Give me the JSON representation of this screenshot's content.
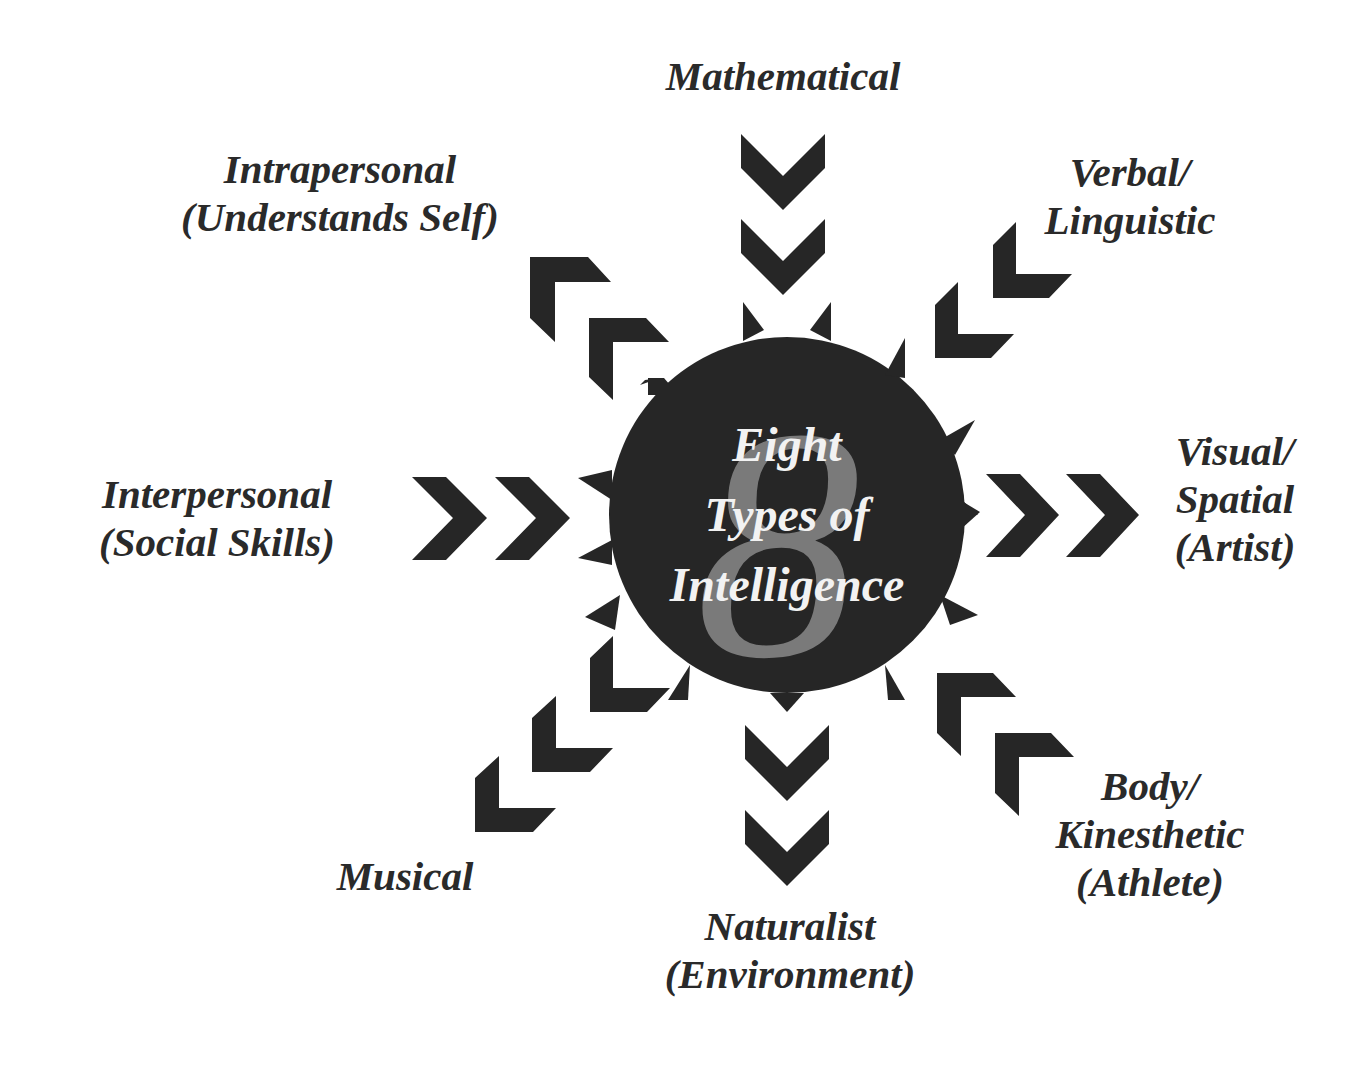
{
  "title": {
    "line1": "Eight",
    "line2": "Types of",
    "line3": "Intelligence",
    "numeral": "8"
  },
  "colors": {
    "disc": "#262626",
    "arrow": "#262626",
    "numeral": "#7a7a7a",
    "center_text": "#f2f2f2",
    "label_text": "#2a2a2a",
    "background": "#ffffff"
  },
  "intelligences": [
    {
      "id": "mathematical",
      "position": "top",
      "lines": [
        "Mathematical"
      ],
      "arrow_direction": "inward"
    },
    {
      "id": "verbal-linguistic",
      "position": "top-right",
      "lines": [
        "Verbal/",
        "Linguistic"
      ],
      "arrow_direction": "inward"
    },
    {
      "id": "visual-spatial",
      "position": "right",
      "lines": [
        "Visual/",
        "Spatial",
        "(Artist)"
      ],
      "arrow_direction": "outward"
    },
    {
      "id": "body-kinesthetic",
      "position": "bottom-right",
      "lines": [
        "Body/",
        "Kinesthetic",
        "(Athlete)"
      ],
      "arrow_direction": "inward"
    },
    {
      "id": "naturalist",
      "position": "bottom",
      "lines": [
        "Naturalist",
        "(Environment)"
      ],
      "arrow_direction": "outward"
    },
    {
      "id": "musical",
      "position": "bottom-left",
      "lines": [
        "Musical"
      ],
      "arrow_direction": "outward"
    },
    {
      "id": "interpersonal",
      "position": "left",
      "lines": [
        "Interpersonal",
        "(Social Skills)"
      ],
      "arrow_direction": "inward"
    },
    {
      "id": "intrapersonal",
      "position": "top-left",
      "lines": [
        "Intrapersonal",
        "(Understands Self)"
      ],
      "arrow_direction": "outward"
    }
  ]
}
